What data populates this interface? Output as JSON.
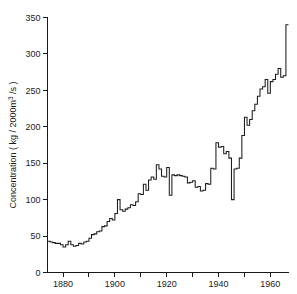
{
  "chart_data": {
    "type": "line",
    "title": "",
    "subtitle": "",
    "xlabel": "",
    "ylabel": "Concentration ( kg / 2000m3 /s )",
    "ylabel_parts": {
      "before": "Concentration ( kg / 2000m",
      "superscript": "3",
      "after": " /s )"
    },
    "xlim": [
      1874,
      1967
    ],
    "ylim": [
      0,
      350
    ],
    "grid": false,
    "legend": null,
    "legend_position": "none",
    "line_style": "step-post",
    "series_color": "#1c1c1c",
    "y_ticks": [
      0,
      50,
      100,
      150,
      200,
      250,
      300,
      350
    ],
    "y_tick_labels": [
      "0",
      "50",
      "100",
      "150",
      "200",
      "250",
      "300",
      "350"
    ],
    "x_ticks_major": [
      1880,
      1900,
      1920,
      1940,
      1960
    ],
    "x_tick_labels": [
      "1880",
      "1900",
      "1920",
      "1940",
      "1960"
    ],
    "x_ticks_minor": [
      1890,
      1910,
      1930,
      1950
    ],
    "x": [
      1874,
      1875,
      1876,
      1877,
      1878,
      1879,
      1880,
      1881,
      1882,
      1883,
      1884,
      1885,
      1886,
      1887,
      1888,
      1889,
      1890,
      1891,
      1892,
      1893,
      1894,
      1895,
      1896,
      1897,
      1898,
      1899,
      1900,
      1901,
      1902,
      1903,
      1904,
      1905,
      1906,
      1907,
      1908,
      1909,
      1910,
      1911,
      1912,
      1913,
      1914,
      1915,
      1916,
      1917,
      1918,
      1919,
      1920,
      1921,
      1922,
      1923,
      1924,
      1925,
      1926,
      1927,
      1928,
      1929,
      1930,
      1931,
      1932,
      1933,
      1934,
      1935,
      1936,
      1937,
      1938,
      1939,
      1940,
      1941,
      1942,
      1943,
      1944,
      1945,
      1946,
      1947,
      1948,
      1949,
      1950,
      1951,
      1952,
      1953,
      1954,
      1955,
      1956,
      1957,
      1958,
      1959,
      1960,
      1961,
      1962,
      1963,
      1964,
      1965,
      1966
    ],
    "values": [
      43,
      42,
      41,
      40,
      40,
      38,
      35,
      38,
      43,
      38,
      36,
      37,
      40,
      39,
      42,
      43,
      47,
      52,
      53,
      56,
      57,
      63,
      64,
      70,
      74,
      72,
      81,
      100,
      86,
      84,
      87,
      89,
      93,
      92,
      97,
      108,
      107,
      121,
      113,
      127,
      131,
      128,
      148,
      142,
      132,
      131,
      144,
      106,
      134,
      133,
      134,
      133,
      132,
      131,
      123,
      124,
      126,
      117,
      118,
      112,
      113,
      122,
      121,
      143,
      142,
      178,
      172,
      173,
      163,
      166,
      157,
      100,
      142,
      143,
      157,
      188,
      213,
      202,
      210,
      222,
      231,
      242,
      252,
      255,
      265,
      246,
      262,
      265,
      272,
      280,
      268,
      270,
      340
    ]
  }
}
